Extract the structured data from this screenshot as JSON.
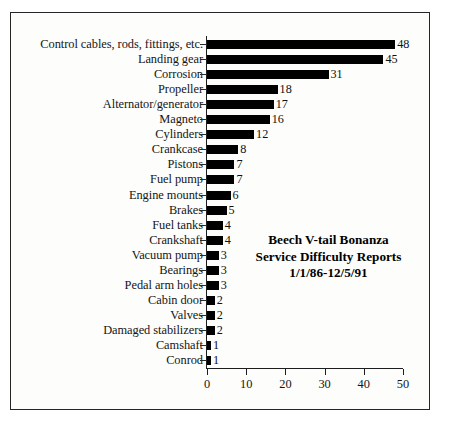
{
  "chart_data": {
    "type": "bar",
    "orientation": "horizontal",
    "title": "Beech V-tail Bonanza Service Difficulty Reports 1/1/86-12/5/91",
    "title_lines": [
      "Beech V-tail Bonanza",
      "Service Difficulty Reports",
      "1/1/86-12/5/91"
    ],
    "xlabel": "",
    "ylabel": "",
    "xlim": [
      0,
      50
    ],
    "ylim": null,
    "grid": false,
    "legend": null,
    "xticks": [
      0,
      10,
      20,
      30,
      40,
      50
    ],
    "xtick_labels": [
      "0",
      "10",
      "20",
      "30",
      "40",
      "50"
    ],
    "categories": [
      "Control cables, rods, fittings, etc.",
      "Landing gear",
      "Corrosion",
      "Propeller",
      "Alternator/generator",
      "Magneto",
      "Cylinders",
      "Crankcase",
      "Pistons",
      "Fuel pump",
      "Engine mounts",
      "Brakes",
      "Fuel tanks",
      "Crankshaft",
      "Vacuum pump",
      "Bearings",
      "Pedal arm holes",
      "Cabin door",
      "Valves",
      "Damaged stabilizers",
      "Camshaft",
      "Conrod"
    ],
    "values": [
      48,
      45,
      31,
      18,
      17,
      16,
      12,
      8,
      7,
      7,
      6,
      5,
      4,
      4,
      3,
      3,
      3,
      2,
      2,
      2,
      1,
      1
    ],
    "value_labels": [
      "48",
      "45",
      "31",
      "18",
      "17",
      "16",
      "12",
      "8",
      "7",
      "7",
      "6",
      "5",
      "4",
      "4",
      "3",
      "3",
      "3",
      "2",
      "2",
      "2",
      "1",
      "1"
    ],
    "bar_color": "#000000",
    "axis_color": "#1d1d1d",
    "background_color": "#fdfdfc",
    "border_color": "#262626"
  }
}
